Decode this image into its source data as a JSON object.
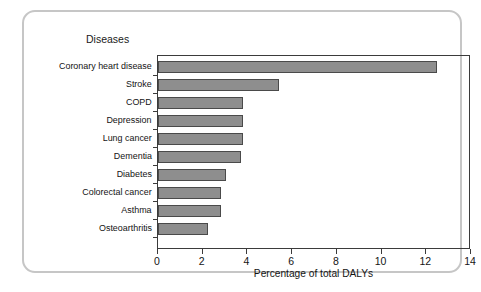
{
  "card": {
    "series_label": "Diseases"
  },
  "chart_data": {
    "type": "bar",
    "orientation": "horizontal",
    "title": "",
    "subtitle": "",
    "xlabel": "Percentage of total DALYs",
    "ylabel": "Diseases",
    "xlim": [
      0,
      14
    ],
    "xticks": [
      0,
      2,
      4,
      6,
      8,
      10,
      12,
      14
    ],
    "xtick_labels": [
      "0",
      "2",
      "4",
      "6",
      "8",
      "10",
      "12",
      "14"
    ],
    "grid": false,
    "legend": false,
    "bar_color": "#8e8e8e",
    "bar_edge_color": "#4a4a4a",
    "categories": [
      "Coronary heart disease",
      "Stroke",
      "COPD",
      "Depression",
      "Lung cancer",
      "Dementia",
      "Diabetes",
      "Colorectal cancer",
      "Asthma",
      "Osteoarthritis"
    ],
    "values": [
      12.5,
      5.4,
      3.8,
      3.8,
      3.8,
      3.7,
      3.05,
      2.8,
      2.8,
      2.25
    ]
  }
}
